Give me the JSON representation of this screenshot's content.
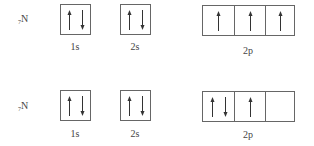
{
  "diagram": {
    "type": "orbital-box-diagram",
    "rows": [
      {
        "element": {
          "subscript": "7",
          "symbol": "N"
        },
        "orbitals": [
          {
            "label": "1s",
            "boxes": [
              [
                "up",
                "down"
              ]
            ]
          },
          {
            "label": "2s",
            "boxes": [
              [
                "up",
                "down"
              ]
            ]
          },
          {
            "label": "2p",
            "boxes": [
              [
                "up"
              ],
              [
                "up"
              ],
              [
                "up"
              ]
            ]
          }
        ]
      },
      {
        "element": {
          "subscript": "7",
          "symbol": "N"
        },
        "orbitals": [
          {
            "label": "1s",
            "boxes": [
              [
                "up",
                "down"
              ]
            ]
          },
          {
            "label": "2s",
            "boxes": [
              [
                "up",
                "down"
              ]
            ]
          },
          {
            "label": "2p",
            "boxes": [
              [
                "up",
                "down"
              ],
              [
                "up"
              ],
              []
            ]
          }
        ]
      }
    ]
  },
  "colors": {
    "line": "#666666",
    "text": "#444444",
    "background": "#ffffff"
  }
}
